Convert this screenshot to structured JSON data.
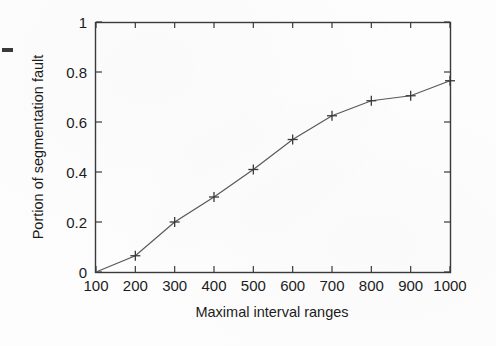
{
  "figure": {
    "background_color": "#fdfdfd",
    "ink_color": "#3a3a3a",
    "text_color": "#1c1c1c"
  },
  "chart_data": {
    "type": "line",
    "title": "",
    "xlabel": "Maximal interval ranges",
    "ylabel": "Portion of segmentation fault",
    "x": [
      100,
      200,
      300,
      400,
      500,
      600,
      700,
      800,
      900,
      1000
    ],
    "values": [
      0.0,
      0.065,
      0.2,
      0.3,
      0.41,
      0.53,
      0.625,
      0.685,
      0.705,
      0.765
    ],
    "series": [
      {
        "name": "Portion of segmentation fault",
        "marker": "plus",
        "values": [
          0.0,
          0.065,
          0.2,
          0.3,
          0.41,
          0.53,
          0.625,
          0.685,
          0.705,
          0.765
        ]
      }
    ],
    "xlim": [
      100,
      1000
    ],
    "ylim": [
      0,
      1
    ],
    "xticks": [
      100,
      200,
      300,
      400,
      500,
      600,
      700,
      800,
      900,
      1000
    ],
    "yticks": [
      0,
      0.2,
      0.4,
      0.6,
      0.8,
      1
    ],
    "xtick_labels": [
      "100",
      "200",
      "300",
      "400",
      "500",
      "600",
      "700",
      "800",
      "900",
      "1000"
    ],
    "ytick_labels": [
      "0",
      "0.2",
      "0.4",
      "0.6",
      "0.8",
      "1"
    ],
    "grid": false,
    "legend": null,
    "frame": "box"
  },
  "artifacts": {
    "left_dash": "scan-artifact-dash"
  }
}
